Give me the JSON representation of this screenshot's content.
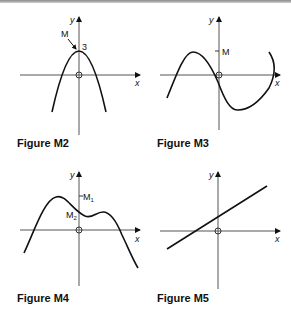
{
  "figures": [
    {
      "id": "M2",
      "caption": "Figure M2",
      "axis_x_label": "x",
      "axis_y_label": "y",
      "annotations": {
        "point_label": "M",
        "value_label": "3"
      },
      "curve": "downward parabola with maximum M at (0, 3)"
    },
    {
      "id": "M3",
      "caption": "Figure M3",
      "axis_x_label": "x",
      "axis_y_label": "y",
      "annotations": {
        "tick_label": "M"
      },
      "curve": "cubic with local max of height M left of y-axis and local min right of y-axis"
    },
    {
      "id": "M4",
      "caption": "Figure M4",
      "axis_x_label": "x",
      "axis_y_label": "y",
      "annotations": {
        "tick_label_1": "M",
        "tick_sub_1": "1",
        "tick_label_2": "M",
        "tick_sub_2": "2"
      },
      "curve": "quartic with two local maxima M1 (higher, left) and M2 (lower, right)"
    },
    {
      "id": "M5",
      "caption": "Figure M5",
      "axis_x_label": "x",
      "axis_y_label": "y",
      "annotations": {},
      "curve": "straight line with positive slope"
    }
  ]
}
